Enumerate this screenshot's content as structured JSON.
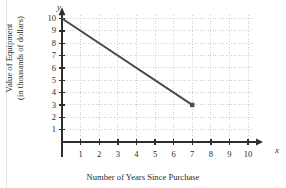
{
  "chart_data": {
    "type": "line",
    "title": "",
    "xlabel": "Number of Years Since Purchase",
    "ylabel": "Value of Equipment (in thousands of dollars)",
    "ylabel_lines": [
      "Value of Equipment",
      "(in thousands of dollars)"
    ],
    "x_axis_name": "x",
    "y_axis_name": "y",
    "xlim": [
      0,
      10.6
    ],
    "ylim": [
      0,
      10.6
    ],
    "xticks": [
      1,
      2,
      3,
      4,
      5,
      6,
      7,
      8,
      9,
      10
    ],
    "yticks": [
      1,
      2,
      3,
      4,
      5,
      6,
      7,
      8,
      9,
      10
    ],
    "xtick_labels": [
      "1",
      "2",
      "3",
      "4",
      "5",
      "6",
      "7",
      "8",
      "9",
      "10"
    ],
    "ytick_labels": [
      "1",
      "2",
      "3",
      "4",
      "5",
      "6",
      "7",
      "8",
      "9",
      "10"
    ],
    "grid": true,
    "grid_style": "dotted",
    "grid_color": "#cfcfcf",
    "legend": null,
    "series": [
      {
        "name": "Equipment value",
        "points": [
          {
            "x": 0,
            "y": 10
          },
          {
            "x": 7,
            "y": 3
          }
        ],
        "color": "#4a4a4a",
        "line_width": 2,
        "start_marker": "none",
        "end_marker": "square"
      }
    ],
    "slope": -1,
    "y_intercept": 10,
    "annotations": []
  },
  "style": {
    "axis_color": "#2e2e2e",
    "line_color": "#4a4a4a",
    "grid_color": "#cfcfcf",
    "text_color": "#2b2b2b",
    "background": "#ffffff"
  }
}
